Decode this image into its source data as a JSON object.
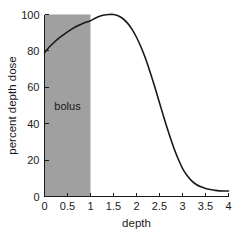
{
  "chart_data": {
    "type": "line",
    "title": "",
    "subtitle": "",
    "xlabel": "depth",
    "ylabel": "percent depth dose",
    "xlim": [
      0,
      4
    ],
    "ylim": [
      0,
      100
    ],
    "grid": false,
    "legend": null,
    "x_ticks": [
      "0",
      "0.5",
      "1",
      "1.5",
      "2",
      "2.5",
      "3",
      "3.5",
      "4"
    ],
    "x_tick_values": [
      0,
      0.5,
      1,
      1.5,
      2,
      2.5,
      3,
      3.5,
      4
    ],
    "y_ticks": [
      "0",
      "20",
      "40",
      "60",
      "80",
      "100"
    ],
    "y_tick_values": [
      0,
      20,
      40,
      60,
      80,
      100
    ],
    "series": [
      {
        "name": "percent depth dose",
        "color": "#1a1a1a",
        "x": [
          0,
          0.1,
          0.2,
          0.3,
          0.4,
          0.5,
          0.6,
          0.7,
          0.8,
          0.9,
          1.0,
          1.1,
          1.2,
          1.3,
          1.4,
          1.5,
          1.6,
          1.7,
          1.8,
          1.9,
          2.0,
          2.1,
          2.2,
          2.3,
          2.4,
          2.5,
          2.6,
          2.7,
          2.8,
          2.9,
          3.0,
          3.1,
          3.2,
          3.3,
          3.4,
          3.5,
          3.6,
          3.7,
          3.8,
          3.9,
          4.0
        ],
        "y": [
          79,
          82,
          84.5,
          86.7,
          88.7,
          90.5,
          92.1,
          93.5,
          94.7,
          95.7,
          96.6,
          97.9,
          99.0,
          99.7,
          100.0,
          100.0,
          99.3,
          97.8,
          95.4,
          92.0,
          87.5,
          82.0,
          75.5,
          68.0,
          60.0,
          51.5,
          43.0,
          35.0,
          27.5,
          21.0,
          15.5,
          11.5,
          8.6,
          6.6,
          5.3,
          4.4,
          3.8,
          3.4,
          3.1,
          3.0,
          3.0
        ]
      }
    ],
    "annotations": [
      {
        "name": "bolus-region",
        "label": "bolus",
        "shape": "rect",
        "x_start": 0,
        "x_end": 1,
        "y_start": 0,
        "y_end": 100,
        "fill_color": "#a0a0a0",
        "label_x": 0.5,
        "label_y": 50
      }
    ]
  }
}
